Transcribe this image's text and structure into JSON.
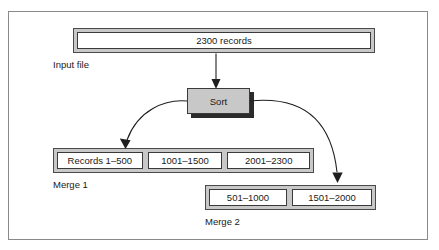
{
  "figure": {
    "type": "flow-diagram"
  },
  "input_file": {
    "box_label": "2300 records",
    "caption": "Input file"
  },
  "process": {
    "label": "Sort"
  },
  "merge1": {
    "caption": "Merge 1",
    "cells": [
      {
        "label": "Records 1–500"
      },
      {
        "label": "1001–1500"
      },
      {
        "label": "2001–2300"
      }
    ]
  },
  "merge2": {
    "caption": "Merge 2",
    "cells": [
      {
        "label": "501–1000"
      },
      {
        "label": "1501–2000"
      }
    ]
  },
  "arrows": [
    {
      "name": "input-to-sort",
      "from": "input_file",
      "to": "process",
      "style": "straight-down"
    },
    {
      "name": "sort-to-merge1",
      "from": "process",
      "to": "merge1",
      "style": "curve-left-down"
    },
    {
      "name": "sort-to-merge2",
      "from": "process",
      "to": "merge2",
      "style": "curve-right-down"
    }
  ],
  "colors": {
    "band_fill": "#c8c8c8",
    "cell_fill": "#ffffff",
    "process_fill": "#c8c8c8",
    "shadow": "#2b2b2b",
    "stroke": "#1f1f1f",
    "frame": "#8a8a8a"
  }
}
